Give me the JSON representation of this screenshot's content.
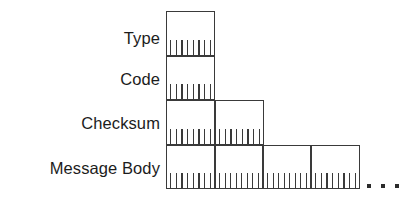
{
  "diagram": {
    "type": "packet-format-diagram",
    "line_color": "#3a3a3a",
    "text_color": "#1c1c1c",
    "background": "#ffffff",
    "rows": [
      {
        "label": "Type",
        "top": 11,
        "bottom": 56,
        "segments": [
          {
            "left": 166,
            "right": 215
          }
        ],
        "ticks_per_segment": 8
      },
      {
        "label": "Code",
        "top": 56,
        "bottom": 100,
        "segments": [
          {
            "left": 166,
            "right": 215
          }
        ],
        "ticks_per_segment": 8
      },
      {
        "label": "Checksum",
        "top": 100,
        "bottom": 145,
        "segments": [
          {
            "left": 166,
            "right": 215
          },
          {
            "left": 215,
            "right": 264
          }
        ],
        "ticks_per_segment": 8
      },
      {
        "label": "Message Body",
        "top": 145,
        "bottom": 189,
        "segments": [
          {
            "left": 166,
            "right": 215
          },
          {
            "left": 215,
            "right": 263
          },
          {
            "left": 263,
            "right": 311
          },
          {
            "left": 311,
            "right": 360
          }
        ],
        "ticks_per_segment": 8
      }
    ],
    "continuation": {
      "name": "ellipsis",
      "dots": 3,
      "left": 367,
      "top": 184
    }
  }
}
